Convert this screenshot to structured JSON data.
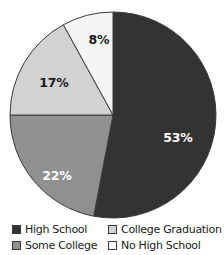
{
  "chart_data": {
    "type": "pie",
    "title": "",
    "categories": [
      "High School",
      "Some College",
      "College Graduation",
      "No High School"
    ],
    "values": [
      53,
      22,
      17,
      8
    ],
    "unit": "%",
    "start_angle_deg": 0,
    "direction": "clockwise",
    "legend_position": "bottom",
    "grid": false,
    "slices": [
      {
        "label": "High School",
        "value": 53,
        "value_text": "53%",
        "color": "#333333",
        "label_color": "#ffffff",
        "label_on": "dark",
        "label_x": 178,
        "label_y": 138
      },
      {
        "label": "Some College",
        "value": 22,
        "value_text": "22%",
        "color": "#909090",
        "label_color": "#ffffff",
        "label_on": "dark",
        "label_x": 57,
        "label_y": 176
      },
      {
        "label": "College Graduation",
        "value": 17,
        "value_text": "17%",
        "color": "#d2d2d2",
        "label_color": "#1a1a1a",
        "label_on": "light",
        "label_x": 54,
        "label_y": 83
      },
      {
        "label": "No High School",
        "value": 8,
        "value_text": "8%",
        "color": "#f5f5f5",
        "label_color": "#1a1a1a",
        "label_on": "light",
        "label_x": 99,
        "label_y": 40
      }
    ]
  },
  "legend": {
    "items": [
      {
        "label": "High School",
        "color": "#333333"
      },
      {
        "label": "College Graduation",
        "color": "#d2d2d2"
      },
      {
        "label": "Some College",
        "color": "#909090"
      },
      {
        "label": "No High School",
        "color": "#f9f9f9"
      }
    ]
  },
  "style": {
    "background": "#ffffff",
    "outline": "#3a3a3a",
    "center_x": 113,
    "center_y": 115,
    "radius": 103
  }
}
